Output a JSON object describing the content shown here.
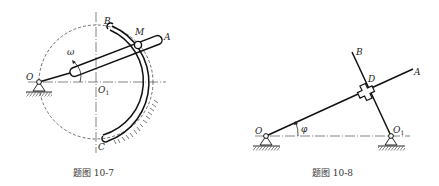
{
  "figures": [
    {
      "id": "fig-10-7",
      "caption": "题图 10-7",
      "labels": {
        "O": "O",
        "O1_main": "O",
        "O1_sub": "1",
        "B": "B",
        "M": "M",
        "A": "A",
        "C": "C",
        "omega": "ω"
      }
    },
    {
      "id": "fig-10-8",
      "caption": "题图 10-8",
      "labels": {
        "O": "O",
        "O1_main": "O",
        "O1_sub": "1",
        "A": "A",
        "B": "B",
        "D": "D",
        "phi": "φ"
      }
    }
  ]
}
